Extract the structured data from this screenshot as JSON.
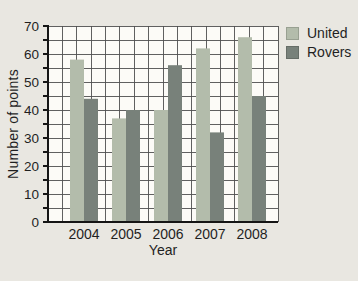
{
  "figure": {
    "ylabel": "Number of points",
    "xlabel": "Year"
  },
  "colors": {
    "page_background": "#e9e7e1",
    "plot_background": "#fcfbf7",
    "grid_line": "#4f4f4f",
    "axis_line": "#151515",
    "united_bar": "#b3bcab",
    "rovers_bar": "#78817a",
    "text": "#1f1f1f"
  },
  "chart_data": {
    "type": "bar",
    "categories": [
      "2004",
      "2005",
      "2006",
      "2007",
      "2008"
    ],
    "series": [
      {
        "name": "United",
        "color": "#b3bcab",
        "values": [
          58,
          37,
          40,
          62,
          66
        ]
      },
      {
        "name": "Rovers",
        "color": "#78817a",
        "values": [
          44,
          40,
          56,
          32,
          45
        ]
      }
    ],
    "title": "",
    "xlabel": "Year",
    "ylabel": "Number of points",
    "ylim": [
      0,
      70
    ],
    "ytick_step": 10,
    "minor_grid_step": 5,
    "grid": true,
    "grid_style": "square-graph-paper",
    "legend_position": "top-right",
    "ytick_labels": [
      "0",
      "10",
      "20",
      "30",
      "40",
      "50",
      "60",
      "70"
    ]
  }
}
